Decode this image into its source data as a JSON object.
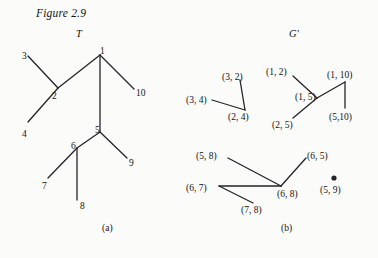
{
  "figure": {
    "title": "Figure 2.9",
    "panels": [
      {
        "id": "a",
        "header": "T",
        "caption": "(a)"
      },
      {
        "id": "b",
        "header": "G'",
        "caption": "(b)"
      }
    ]
  },
  "tree_T": {
    "header": "T",
    "caption": "(a)",
    "nodes": [
      {
        "id": "1",
        "label": "1",
        "x": 100,
        "y": 55,
        "label_x": 100,
        "label_y": 47,
        "kind": "internal"
      },
      {
        "id": "2",
        "label": "2",
        "x": 58,
        "y": 88,
        "label_x": 52,
        "label_y": 92,
        "kind": "internal"
      },
      {
        "id": "3",
        "label": "3",
        "x": 28,
        "y": 56,
        "label_x": 22,
        "label_y": 52,
        "kind": "leaf"
      },
      {
        "id": "4",
        "label": "4",
        "x": 28,
        "y": 122,
        "label_x": 22,
        "label_y": 130,
        "kind": "leaf"
      },
      {
        "id": "5",
        "label": "5",
        "x": 100,
        "y": 132,
        "label_x": 95,
        "label_y": 126,
        "kind": "internal"
      },
      {
        "id": "6",
        "label": "6",
        "x": 77,
        "y": 148,
        "label_x": 71,
        "label_y": 142,
        "kind": "internal"
      },
      {
        "id": "7",
        "label": "7",
        "x": 48,
        "y": 178,
        "label_x": 42,
        "label_y": 182,
        "kind": "leaf"
      },
      {
        "id": "8",
        "label": "8",
        "x": 77,
        "y": 200,
        "label_x": 80,
        "label_y": 202,
        "kind": "leaf"
      },
      {
        "id": "9",
        "label": "9",
        "x": 127,
        "y": 158,
        "label_x": 129,
        "label_y": 159,
        "kind": "leaf"
      },
      {
        "id": "10",
        "label": "10",
        "x": 134,
        "y": 89,
        "label_x": 136,
        "label_y": 89,
        "kind": "leaf"
      }
    ],
    "edges": [
      {
        "from": "3",
        "to": "2"
      },
      {
        "from": "2",
        "to": "1"
      },
      {
        "from": "2",
        "to": "4"
      },
      {
        "from": "1",
        "to": "10"
      },
      {
        "from": "1",
        "to": "5"
      },
      {
        "from": "5",
        "to": "6"
      },
      {
        "from": "5",
        "to": "9"
      },
      {
        "from": "6",
        "to": "7"
      },
      {
        "from": "6",
        "to": "8"
      }
    ]
  },
  "graph_Gprime": {
    "header": "G'",
    "caption": "(b)",
    "nodes": [
      {
        "id": "3_2",
        "label": "(3, 2)",
        "x": 240,
        "y": 80,
        "label_x": 222,
        "label_y": 73,
        "anchor": "left"
      },
      {
        "id": "3_4",
        "label": "(3, 4)",
        "x": 212,
        "y": 100,
        "label_x": 186,
        "label_y": 96,
        "anchor": "left"
      },
      {
        "id": "2_4",
        "label": "(2, 4)",
        "x": 245,
        "y": 110,
        "label_x": 228,
        "label_y": 113,
        "anchor": "left"
      },
      {
        "id": "1_2",
        "label": "(1, 2)",
        "x": 293,
        "y": 76,
        "label_x": 266,
        "label_y": 68,
        "anchor": "left"
      },
      {
        "id": "1_5",
        "label": "(1, 5)",
        "x": 317,
        "y": 98,
        "label_x": 295,
        "label_y": 93,
        "anchor": "left"
      },
      {
        "id": "1_10",
        "label": "(1, 10)",
        "x": 345,
        "y": 82,
        "label_x": 327,
        "label_y": 71,
        "anchor": "left"
      },
      {
        "id": "5_10",
        "label": "(5,10)",
        "x": 345,
        "y": 108,
        "label_x": 329,
        "label_y": 113,
        "anchor": "left"
      },
      {
        "id": "2_5",
        "label": "(2, 5)",
        "x": 293,
        "y": 118,
        "label_x": 272,
        "label_y": 121,
        "anchor": "left"
      },
      {
        "id": "5_8",
        "label": "(5, 8)",
        "x": 228,
        "y": 158,
        "label_x": 196,
        "label_y": 152,
        "anchor": "left"
      },
      {
        "id": "6_5",
        "label": "(6, 5)",
        "x": 306,
        "y": 158,
        "label_x": 307,
        "label_y": 152,
        "anchor": "left"
      },
      {
        "id": "6_7",
        "label": "(6, 7)",
        "x": 219,
        "y": 186,
        "label_x": 186,
        "label_y": 184,
        "anchor": "left"
      },
      {
        "id": "6_8",
        "label": "(6, 8)",
        "x": 281,
        "y": 186,
        "label_x": 277,
        "label_y": 190,
        "anchor": "left"
      },
      {
        "id": "7_8",
        "label": "(7, 8)",
        "x": 253,
        "y": 203,
        "label_x": 241,
        "label_y": 206,
        "anchor": "left"
      },
      {
        "id": "5_9",
        "label": "(5, 9)",
        "x": 334,
        "y": 178,
        "label_x": 320,
        "label_y": 186,
        "anchor": "left",
        "isolated": true
      }
    ],
    "edges": [
      {
        "from": "3_2",
        "to": "2_4"
      },
      {
        "from": "3_4",
        "to": "2_4"
      },
      {
        "from": "1_2",
        "to": "1_5"
      },
      {
        "from": "1_5",
        "to": "2_5"
      },
      {
        "from": "1_5",
        "to": "1_10"
      },
      {
        "from": "1_10",
        "to": "5_10"
      },
      {
        "from": "5_8",
        "to": "6_8"
      },
      {
        "from": "6_5",
        "to": "6_8"
      },
      {
        "from": "6_7",
        "to": "6_8"
      },
      {
        "from": "6_7",
        "to": "7_8"
      }
    ]
  },
  "style": {
    "line_color": "#24242a",
    "text_color": "#141414",
    "background": "#fbfbf9",
    "line_width": 1.3,
    "dot_radius": 2.6
  },
  "layout": {
    "title_x": 36,
    "title_y": 8,
    "panel_a_header_x": 76,
    "panel_a_header_y": 29,
    "panel_b_header_x": 289,
    "panel_b_header_y": 29,
    "caption_a_x": 102,
    "caption_a_y": 224,
    "caption_b_x": 281,
    "caption_b_y": 224
  }
}
